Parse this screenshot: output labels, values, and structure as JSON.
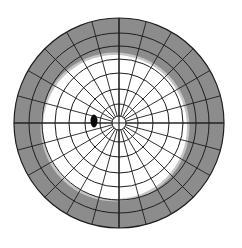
{
  "diagram": {
    "type": "visual-field-perimetry-chart",
    "canvas": {
      "width": 242,
      "height": 248,
      "background": "#ffffff"
    },
    "center": {
      "x": 119,
      "y": 123
    },
    "outer_radius": 105,
    "rings_radii": [
      7,
      19,
      34,
      50,
      64,
      77,
      90,
      105
    ],
    "inner_spokes": {
      "count": 24,
      "start_radius": 7
    },
    "axes": {
      "horizontal": true,
      "vertical": true
    },
    "colors": {
      "field_loss": "#8c8c8c",
      "field_loss_edge": "#c4c4c4",
      "preserved_field": "#ffffff",
      "grid_line": "#1e1e1e",
      "blind_spot": "#0a0a0a"
    },
    "preserved_field_region": {
      "cx": 115,
      "cy": 127,
      "rx": 72,
      "ry": 72
    },
    "blind_spot": {
      "cx": 94,
      "cy": 121,
      "rx": 3.5,
      "ry": 6.5
    }
  }
}
